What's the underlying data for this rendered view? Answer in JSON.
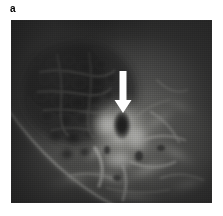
{
  "figure": {
    "panel_label": "a",
    "modality": "radiograph",
    "caption_alt": "Grayscale radiographic image with a white downward arrow indicating a dark oval lesion within a bright sclerotic bony region",
    "frame": {
      "left": 11,
      "top": 20,
      "width": 201,
      "height": 183,
      "background_color": "#3a3a3a"
    },
    "annotations": [
      {
        "name": "pointer-arrow",
        "shape": "arrow",
        "direction": "down",
        "color": "#ffffff",
        "shaft_x": 112,
        "shaft_top": 51,
        "shaft_bottom": 80,
        "shaft_width": 7,
        "head_width": 17,
        "head_tip_y": 93,
        "points_to": "dark-oval-lesion"
      }
    ],
    "features": [
      {
        "name": "mottled-dark-region",
        "description": "coarse mottled low-density trabecular area, upper-left quadrant",
        "tone": "#2b2b2b"
      },
      {
        "name": "bright-sclerotic-mass",
        "description": "bright high-density bony mass in centre of field",
        "tone": "#e8e8e6"
      },
      {
        "name": "dark-oval-lesion",
        "description": "dark oval lucency at arrow tip",
        "tone": "#1a1a1a",
        "center_x": 111,
        "center_y": 106,
        "radius_x": 9,
        "radius_y": 15
      },
      {
        "name": "bright-curved-arc",
        "description": "thin bright curved line sweeping from upper-left to lower-right across lower-left quadrant",
        "tone": "#cfcfc9"
      },
      {
        "name": "bony-struts-lower",
        "description": "branching bright bony struts in the lower half of the field",
        "tone": "#d8d8d4"
      }
    ],
    "palette": {
      "page_background": "#ffffff",
      "label_color": "#000000",
      "film_dark": "#252525",
      "film_mid": "#6e6e6e",
      "film_bright": "#ededea",
      "arrow_color": "#ffffff"
    }
  }
}
